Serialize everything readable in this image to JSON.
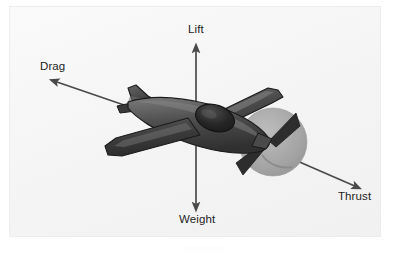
{
  "figure": {
    "background_color": "#f6f6f6",
    "page_color": "#ffffff",
    "border_color": "#ededed"
  },
  "labels": {
    "lift": "Lift",
    "drag": "Drag",
    "thrust": "Thrust",
    "weight": "Weight",
    "text_color": "#1e1e1e"
  },
  "arrows": {
    "lift": {
      "name": "lift-arrow",
      "direction": "up",
      "from": [
        196,
        120
      ],
      "to": [
        196,
        46
      ],
      "color": "#4a4a4a"
    },
    "weight": {
      "name": "weight-arrow",
      "direction": "down",
      "from": [
        196,
        146
      ],
      "to": [
        196,
        209
      ],
      "color": "#4a4a4a"
    },
    "drag": {
      "name": "drag-arrow",
      "direction": "up-left",
      "from": [
        124,
        105
      ],
      "to": [
        51,
        80
      ],
      "color": "#4a4a4a"
    },
    "thrust": {
      "name": "thrust-arrow",
      "direction": "down-right",
      "from": [
        288,
        157
      ],
      "to": [
        360,
        188
      ],
      "color": "#4a4a4a"
    }
  },
  "aircraft": {
    "name": "airplane-illustration",
    "body_color": "#3d3d3d",
    "highlight_color": "#6e6e6e",
    "shadow_color": "#2a2a2a",
    "canopy_color": "#232323",
    "propeller_disc_color": "#a8a8a8",
    "propeller_blade_color": "#2d2d2d",
    "outline_color": "#1a1a1a"
  },
  "icon_names": {
    "lift": "arrow-up-icon",
    "weight": "arrow-down-icon",
    "drag": "arrow-up-left-icon",
    "thrust": "arrow-down-right-icon",
    "plane": "airplane-icon",
    "propeller": "propeller-icon"
  }
}
